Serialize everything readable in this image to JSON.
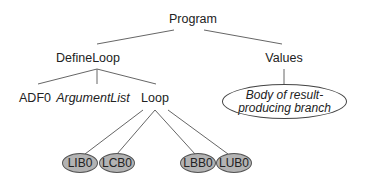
{
  "tree": {
    "root": "Program",
    "level1": {
      "left": "DefineLoop",
      "right": "Values"
    },
    "define_loop_children": {
      "adf": "ADF0",
      "argument_list": "ArgumentList",
      "loop": "Loop"
    },
    "values_child": {
      "line1": "Body of result-",
      "line2": "producing branch"
    },
    "loop_children": [
      "LIB0",
      "LCB0",
      "LBB0",
      "LUB0"
    ]
  },
  "colors": {
    "line": "#555555",
    "oval_fill": "#b3b3b3",
    "text": "#222222"
  }
}
